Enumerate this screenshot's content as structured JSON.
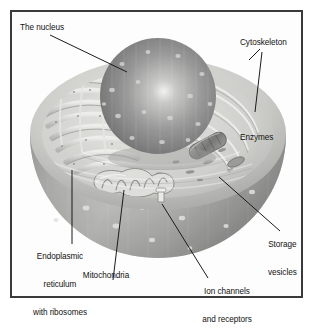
{
  "figure": {
    "frame_color": "#3a3a3c",
    "background_color": "#ffffff",
    "text_color": "#111111"
  },
  "labels": {
    "nucleus": {
      "text": "The nucleus",
      "name": "label-the-nucleus"
    },
    "cytoskeleton": {
      "text": "Cytoskeleton",
      "name": "label-cytoskeleton"
    },
    "enzymes": {
      "text": "Enzymes",
      "name": "label-enzymes"
    },
    "storage": {
      "line1": "Storage",
      "line2": "vesicles",
      "name": "label-storage-vesicles"
    },
    "er": {
      "line1": "Endoplasmic",
      "line2": "reticulum",
      "line3": "with ribosomes",
      "name": "label-endoplasmic-reticulum"
    },
    "mitochondria": {
      "text": "Mitochondria",
      "name": "label-mitochondria"
    },
    "ion_channels": {
      "line1": "Ion channels",
      "line2": "and receptors",
      "name": "label-ion-channels"
    }
  },
  "structures": [
    {
      "id": "nucleus",
      "label": "The nucleus"
    },
    {
      "id": "cytoskeleton",
      "label": "Cytoskeleton"
    },
    {
      "id": "enzymes",
      "label": "Enzymes"
    },
    {
      "id": "storage-vesicles",
      "label": "Storage vesicles"
    },
    {
      "id": "endoplasmic-reticulum",
      "label": "Endoplasmic reticulum with ribosomes"
    },
    {
      "id": "mitochondria",
      "label": "Mitochondria"
    },
    {
      "id": "ion-channels",
      "label": "Ion channels and receptors"
    }
  ],
  "palette": {
    "cell_light": "#d9d9d7",
    "cell_mid": "#b4b4b2",
    "cell_dark": "#8f8f8e",
    "nucleus_light": "#ececeb",
    "nucleus_mid": "#a9a9a8",
    "nucleus_dark": "#6f6f70",
    "interior": "#cfcfcc",
    "line": "#1b1b1d"
  }
}
